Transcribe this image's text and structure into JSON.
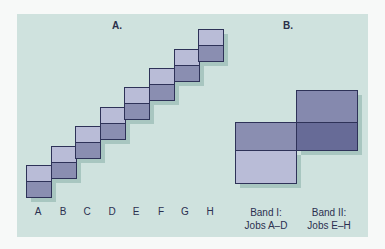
{
  "panel_a": {
    "title": "A.",
    "jobs": [
      "A",
      "B",
      "C",
      "D",
      "E",
      "F",
      "G",
      "H"
    ]
  },
  "panel_b": {
    "title": "B.",
    "bands": [
      {
        "line1": "Band I:",
        "line2": "Jobs A–D"
      },
      {
        "line1": "Band II:",
        "line2": "Jobs E–H"
      }
    ]
  },
  "colors": {
    "background_panel": "#cfe2de",
    "cell_light": "#b9bcd7",
    "cell_dark": "#8a8eb1",
    "cell_overlap": "#676b97",
    "outline": "#2e3258",
    "shadow": "#a8c6c0"
  }
}
